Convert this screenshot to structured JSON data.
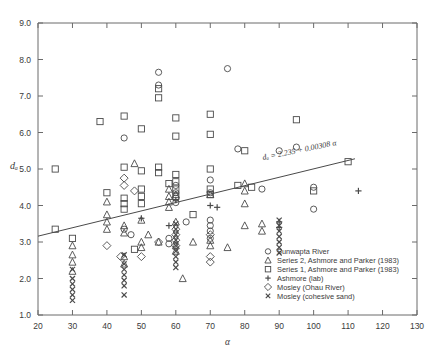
{
  "chart_data": {
    "type": "scatter",
    "title": "",
    "xlabel": "α",
    "ylabel": "dₐ",
    "xlim": [
      20,
      130
    ],
    "ylim": [
      1.0,
      9.0
    ],
    "xticks": [
      20,
      30,
      40,
      50,
      60,
      70,
      80,
      90,
      100,
      110,
      120,
      130
    ],
    "yticks": [
      1.0,
      2.0,
      3.0,
      4.0,
      5.0,
      6.0,
      7.0,
      8.0,
      9.0
    ],
    "ytick_labels": [
      "1.0",
      "2.0",
      "3.0",
      "4.0",
      "5.0",
      "6.0",
      "7.0",
      "8.0",
      "9.0"
    ],
    "xtick_labels": [
      "20",
      "30",
      "40",
      "50",
      "60",
      "70",
      "80",
      "90",
      "100",
      "110",
      "120",
      "130"
    ],
    "grid": false,
    "legend_position": "lower-right",
    "annotations": [
      {
        "name": "regression-equation",
        "text": "dₐ = 2.235 + 0.00308 α",
        "x": 96,
        "y": 5.45,
        "rotation": -11.5
      }
    ],
    "trendline": {
      "name": "regression-line",
      "equation": "d_a = 2.235 + 0.00308*alpha",
      "intercept": 2.235,
      "slope": 0.00308,
      "x_start": 20,
      "x_end": 112,
      "note": "drawn line is steeper than stated coefficients; endpoints read from pixels",
      "y_start_px": 3.16,
      "y_end_px": 5.28
    },
    "series": [
      {
        "name": "Sunwapta River",
        "marker": "circle",
        "points": [
          [
            45,
            5.85
          ],
          [
            55,
            7.65
          ],
          [
            55,
            7.3
          ],
          [
            60,
            4.55
          ],
          [
            60,
            4.35
          ],
          [
            60,
            4.2
          ],
          [
            60,
            4.08
          ],
          [
            63,
            3.55
          ],
          [
            75,
            7.75
          ],
          [
            78,
            5.55
          ],
          [
            85,
            4.45
          ],
          [
            90,
            5.5
          ],
          [
            95,
            5.6
          ],
          [
            100,
            4.5
          ],
          [
            100,
            3.9
          ],
          [
            45,
            3.35
          ],
          [
            47,
            3.2
          ],
          [
            70,
            4.7
          ],
          [
            70,
            4.35
          ],
          [
            70,
            3.6
          ],
          [
            70,
            3.45
          ],
          [
            70,
            3.3
          ],
          [
            70,
            3.1
          ],
          [
            58,
            3.1
          ],
          [
            58,
            2.95
          ]
        ]
      },
      {
        "name": "Series 2, Ashmore and Parker (1983)",
        "marker": "triangle",
        "points": [
          [
            30,
            2.9
          ],
          [
            30,
            2.65
          ],
          [
            30,
            2.45
          ],
          [
            30,
            2.2
          ],
          [
            40,
            4.1
          ],
          [
            40,
            3.75
          ],
          [
            40,
            3.55
          ],
          [
            40,
            3.35
          ],
          [
            45,
            3.45
          ],
          [
            45,
            3.25
          ],
          [
            48,
            5.15
          ],
          [
            50,
            3.6
          ],
          [
            50,
            3.0
          ],
          [
            50,
            2.85
          ],
          [
            55,
            3.0
          ],
          [
            58,
            4.45
          ],
          [
            58,
            4.25
          ],
          [
            58,
            4.1
          ],
          [
            58,
            3.95
          ],
          [
            60,
            4.3
          ],
          [
            60,
            3.55
          ],
          [
            60,
            2.9
          ],
          [
            60,
            2.75
          ],
          [
            65,
            3.0
          ],
          [
            70,
            4.3
          ],
          [
            70,
            3.05
          ],
          [
            70,
            2.9
          ],
          [
            75,
            2.85
          ],
          [
            80,
            4.6
          ],
          [
            80,
            4.4
          ],
          [
            80,
            3.45
          ],
          [
            85,
            3.5
          ],
          [
            85,
            3.3
          ],
          [
            62,
            2.0
          ],
          [
            45,
            2.6
          ],
          [
            45,
            2.4
          ],
          [
            80,
            4.05
          ],
          [
            52,
            3.2
          ]
        ]
      },
      {
        "name": "Series 1, Ashmore and Parker (1983)",
        "marker": "square",
        "points": [
          [
            25,
            5.0
          ],
          [
            25,
            3.35
          ],
          [
            30,
            3.1
          ],
          [
            38,
            6.3
          ],
          [
            40,
            4.35
          ],
          [
            45,
            6.45
          ],
          [
            45,
            5.05
          ],
          [
            45,
            4.2
          ],
          [
            45,
            4.05
          ],
          [
            45,
            3.9
          ],
          [
            48,
            2.8
          ],
          [
            50,
            6.1
          ],
          [
            50,
            4.95
          ],
          [
            50,
            4.45
          ],
          [
            50,
            4.25
          ],
          [
            50,
            4.05
          ],
          [
            55,
            6.95
          ],
          [
            55,
            7.2
          ],
          [
            60,
            6.4
          ],
          [
            60,
            5.9
          ],
          [
            60,
            4.85
          ],
          [
            60,
            4.65
          ],
          [
            60,
            4.45
          ],
          [
            60,
            4.25
          ],
          [
            65,
            3.75
          ],
          [
            70,
            6.5
          ],
          [
            70,
            5.95
          ],
          [
            70,
            5.0
          ],
          [
            70,
            4.45
          ],
          [
            70,
            4.3
          ],
          [
            80,
            5.5
          ],
          [
            82,
            4.5
          ],
          [
            95,
            6.35
          ],
          [
            100,
            4.4
          ],
          [
            110,
            5.2
          ],
          [
            55,
            5.05
          ],
          [
            55,
            4.9
          ],
          [
            58,
            4.6
          ],
          [
            78,
            4.55
          ]
        ]
      },
      {
        "name": "Ashmore (lab)",
        "marker": "plus",
        "points": [
          [
            50,
            3.65
          ],
          [
            58,
            3.45
          ],
          [
            60,
            4.15
          ],
          [
            70,
            4.0
          ],
          [
            72,
            3.95
          ],
          [
            90,
            3.55
          ],
          [
            90,
            3.4
          ],
          [
            113,
            4.4
          ]
        ]
      },
      {
        "name": "Mosley (Ohau River)",
        "marker": "diamond",
        "points": [
          [
            40,
            2.9
          ],
          [
            45,
            4.75
          ],
          [
            45,
            4.55
          ],
          [
            48,
            4.4
          ],
          [
            55,
            3.0
          ],
          [
            60,
            3.35
          ],
          [
            60,
            3.2
          ],
          [
            60,
            3.05
          ],
          [
            60,
            2.9
          ],
          [
            70,
            3.2
          ],
          [
            70,
            2.6
          ],
          [
            70,
            2.45
          ],
          [
            50,
            2.6
          ],
          [
            44,
            2.6
          ]
        ]
      },
      {
        "name": "Mosley (cohesive sand)",
        "marker": "x",
        "points": [
          [
            30,
            2.25
          ],
          [
            30,
            2.0
          ],
          [
            30,
            1.85
          ],
          [
            30,
            1.7
          ],
          [
            30,
            1.55
          ],
          [
            30,
            1.4
          ],
          [
            45,
            2.65
          ],
          [
            45,
            2.4
          ],
          [
            45,
            2.25
          ],
          [
            45,
            2.1
          ],
          [
            45,
            1.95
          ],
          [
            45,
            1.8
          ],
          [
            45,
            1.55
          ],
          [
            60,
            3.5
          ],
          [
            60,
            3.35
          ],
          [
            60,
            3.2
          ],
          [
            60,
            3.05
          ],
          [
            60,
            2.9
          ],
          [
            60,
            2.75
          ],
          [
            60,
            2.6
          ],
          [
            60,
            2.45
          ],
          [
            60,
            2.3
          ],
          [
            90,
            3.6
          ],
          [
            90,
            3.45
          ],
          [
            90,
            3.3
          ],
          [
            90,
            3.15
          ],
          [
            90,
            3.0
          ],
          [
            90,
            2.85
          ],
          [
            90,
            2.7
          ]
        ]
      }
    ],
    "legend": [
      {
        "label": "Sunwapta River",
        "marker": "circle"
      },
      {
        "label": "Series 2, Ashmore and Parker (1983)",
        "marker": "triangle"
      },
      {
        "label": "Series 1, Ashmore and Parker (1983)",
        "marker": "square"
      },
      {
        "label": "Ashmore (lab)",
        "marker": "plus"
      },
      {
        "label": "Mosley (Ohau River)",
        "marker": "diamond"
      },
      {
        "label": "Mosley (cohesive sand)",
        "marker": "x"
      }
    ]
  },
  "style": {
    "axis_color": "#6b6b6b",
    "marker_color": "#4a4a4a",
    "text_color": "#3a3a3a",
    "background": "#ffffff"
  }
}
